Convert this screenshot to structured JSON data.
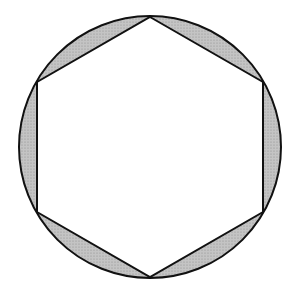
{
  "diagram": {
    "circle": {
      "cx": 150,
      "cy": 147,
      "r": 131
    },
    "hexagon": {
      "vertices": [
        [
          150,
          17
        ],
        [
          263,
          82
        ],
        [
          263,
          212
        ],
        [
          150,
          277
        ],
        [
          37,
          212
        ],
        [
          37,
          82
        ]
      ]
    },
    "colors": {
      "stroke": "#111111",
      "segment_fill": "#c4c4c4",
      "stipple": "#8e8e8e",
      "interior": "#ffffff",
      "background": "#ffffff"
    },
    "stroke_width": 2
  }
}
